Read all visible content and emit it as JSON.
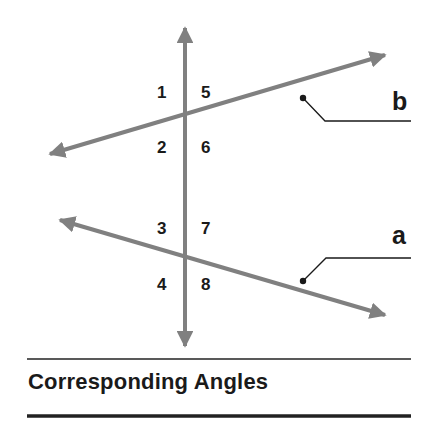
{
  "diagram": {
    "title": "Corresponding Angles",
    "colors": {
      "transversal": "#808080",
      "lines": "#808080",
      "text": "#1a1a1a",
      "rules": "#222222",
      "background": "#ffffff"
    },
    "lines": [
      {
        "name": "b",
        "label": "b"
      },
      {
        "name": "a",
        "label": "a"
      }
    ],
    "angle_labels": {
      "1": "1",
      "2": "2",
      "3": "3",
      "4": "4",
      "5": "5",
      "6": "6",
      "7": "7",
      "8": "8"
    }
  }
}
